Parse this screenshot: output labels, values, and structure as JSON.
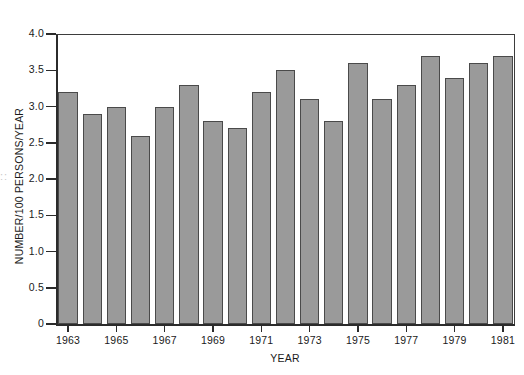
{
  "chart_data": {
    "type": "bar",
    "title": "",
    "xlabel": "YEAR",
    "ylabel": "NUMBER/100 PERSONS/YEAR",
    "categories": [
      1963,
      1964,
      1965,
      1966,
      1967,
      1968,
      1969,
      1970,
      1971,
      1972,
      1973,
      1974,
      1975,
      1976,
      1977,
      1978,
      1979,
      1980,
      1981
    ],
    "values": [
      3.2,
      2.9,
      3.0,
      2.6,
      3.0,
      3.3,
      2.8,
      2.7,
      3.2,
      3.5,
      3.1,
      2.8,
      3.6,
      3.1,
      3.3,
      3.7,
      3.4,
      3.6,
      3.7
    ],
    "ylim": [
      0,
      4.0
    ],
    "ytick_values": [
      0,
      0.5,
      1.0,
      1.5,
      2.0,
      2.5,
      3.0,
      3.5,
      4.0
    ],
    "ytick_labels": [
      "0",
      "0.5",
      "1.0",
      "1.5",
      "2.0",
      "2.5",
      "3.0",
      "3.5",
      "4.0"
    ],
    "xtick_labels": [
      "1963",
      "1965",
      "1967",
      "1969",
      "1971",
      "1973",
      "1975",
      "1977",
      "1979",
      "1981"
    ],
    "xtick_categories": [
      1963,
      1965,
      1967,
      1969,
      1971,
      1973,
      1975,
      1977,
      1979,
      1981
    ],
    "grid": false,
    "legend": null,
    "bar_color": "#9a9a9a",
    "bar_edge_color": "#4a4a4a",
    "axis_color": "#2b2b2b",
    "background_color": "#ffffff"
  },
  "artifact": {
    "edge_mark": "::"
  }
}
